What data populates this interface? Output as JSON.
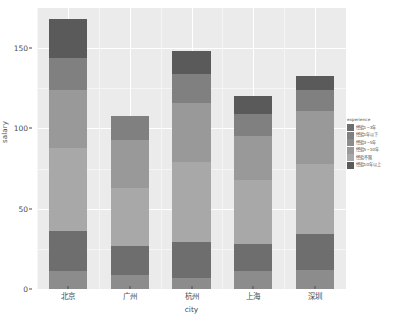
{
  "chart_data": {
    "type": "bar",
    "subtype": "stacked",
    "title": "",
    "xlabel": "city",
    "ylabel": "salary",
    "categories": [
      "北京",
      "广州",
      "杭州",
      "上海",
      "深圳"
    ],
    "ylim": [
      0,
      175
    ],
    "yticks": [
      0,
      50,
      100,
      150
    ],
    "ytick_labels": [
      "0",
      "50",
      "100",
      "150"
    ],
    "grid": true,
    "grid_color": "#ffffff",
    "panel_background": "#ebebeb",
    "plot_background": "#ffffff",
    "legend_position": "right",
    "legend_title": "experience",
    "series": [
      {
        "name": "经验1~3年",
        "color": "#8c8c8c",
        "values": [
          11,
          9,
          7,
          11,
          12
        ]
      },
      {
        "name": "经验1年以下",
        "color": "#6e6e6e",
        "values": [
          25,
          18,
          22,
          17,
          22
        ]
      },
      {
        "name": "经验3~5年",
        "color": "#a8a8a8",
        "values": [
          52,
          36,
          50,
          40,
          44
        ]
      },
      {
        "name": "经验5~10年",
        "color": "#999999",
        "values": [
          36,
          30,
          37,
          27,
          33
        ]
      },
      {
        "name": "经验不限",
        "color": "#808080",
        "values": [
          20,
          15,
          18,
          14,
          13
        ]
      },
      {
        "name": "经验10年以上",
        "color": "#5a5a5a",
        "values": [
          24,
          0,
          14,
          11,
          9
        ]
      }
    ],
    "totals": [
      168,
      108,
      148,
      120,
      133
    ]
  },
  "legend": {
    "title": "experience",
    "items": [
      {
        "label": "经验1~3年",
        "color": "#6e6e6e"
      },
      {
        "label": "经验1年以下",
        "color": "#808080"
      },
      {
        "label": "经验3~5年",
        "color": "#8c8c8c"
      },
      {
        "label": "经验5~10年",
        "color": "#999999"
      },
      {
        "label": "经验不限",
        "color": "#a8a8a8"
      },
      {
        "label": "经验10年以上",
        "color": "#5a5a5a"
      }
    ]
  },
  "axes": {
    "y_title": "salary",
    "x_title": "city"
  }
}
